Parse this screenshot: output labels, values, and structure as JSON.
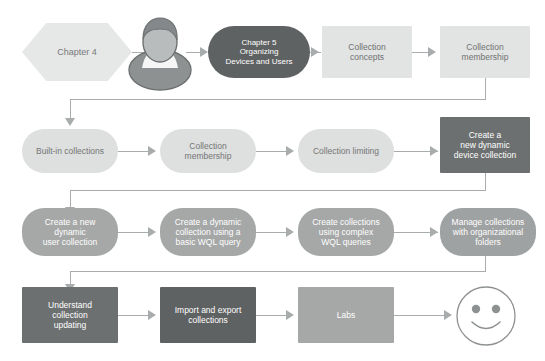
{
  "diagram": {
    "colors": {
      "light_fill": "#e2e3e3",
      "mid_fill": "#a6a8a8",
      "dark_fill": "#6d7070",
      "darker_fill": "#5f6263",
      "connector": "#a9acad",
      "light_text": "#6f7271",
      "dark_text": "#ffffff",
      "background": "#ffffff"
    },
    "rows": [
      {
        "row": 1,
        "nodes": [
          {
            "id": "chapter-4",
            "label": "Chapter 4",
            "shape": "hexagon",
            "style": "light"
          },
          {
            "id": "person",
            "label": "",
            "shape": "icon",
            "icon": "person-avatar-icon",
            "style": "mid"
          },
          {
            "id": "chapter-5",
            "label": "Chapter 5\nOrganizing\nDevices and Users",
            "shape": "pill",
            "style": "darker"
          },
          {
            "id": "collection-concepts",
            "label": "Collection\nconcepts",
            "shape": "rect",
            "style": "light"
          },
          {
            "id": "collection-membership-1",
            "label": "Collection\nmembership",
            "shape": "rect",
            "style": "light"
          }
        ]
      },
      {
        "row": 2,
        "nodes": [
          {
            "id": "built-in-collections",
            "label": "Built-in collections",
            "shape": "pill",
            "style": "light"
          },
          {
            "id": "collection-membership-2",
            "label": "Collection\nmembership",
            "shape": "pill",
            "style": "light"
          },
          {
            "id": "collection-limiting",
            "label": "Collection limiting",
            "shape": "pill",
            "style": "light"
          },
          {
            "id": "create-new-dynamic-device-collection",
            "label": "Create a\nnew dynamic\ndevice collection",
            "shape": "rect",
            "style": "dark"
          }
        ]
      },
      {
        "row": 3,
        "nodes": [
          {
            "id": "create-new-dynamic-user-collection",
            "label": "Create a new\ndynamic\nuser collection",
            "shape": "pill",
            "style": "mid"
          },
          {
            "id": "create-dynamic-collection-basic-wql",
            "label": "Create a dynamic\ncollection using a\nbasic WQL query",
            "shape": "pill",
            "style": "mid"
          },
          {
            "id": "create-collections-complex-wql",
            "label": "Create collections\nusing complex\nWQL queries",
            "shape": "pill",
            "style": "mid"
          },
          {
            "id": "manage-collections-organizational-folders",
            "label": "Manage collections\nwith organizational\nfolders",
            "shape": "pill",
            "style": "mid"
          }
        ]
      },
      {
        "row": 4,
        "nodes": [
          {
            "id": "understand-collection-updating",
            "label": "Understand\ncollection\nupdating",
            "shape": "rect",
            "style": "dark"
          },
          {
            "id": "import-and-export-collections",
            "label": "Import and export\ncollections",
            "shape": "rect",
            "style": "darker"
          },
          {
            "id": "labs",
            "label": "Labs",
            "shape": "rect",
            "style": "mid"
          },
          {
            "id": "smiley",
            "label": "",
            "shape": "icon",
            "icon": "smiley-face-icon",
            "style": "outline"
          }
        ]
      }
    ]
  }
}
